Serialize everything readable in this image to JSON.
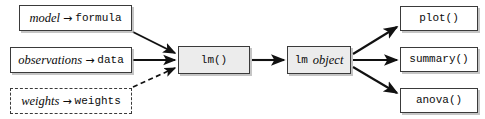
{
  "diagram": {
    "arrow_glyph": "→",
    "colors": {
      "stroke": "#3a3a3a",
      "edge": "#111111",
      "node_fill": "#ffffff",
      "node_fill_emphasis": "#ececec",
      "text": "#0b0b0b",
      "background": "#ffffff"
    },
    "inputs": [
      {
        "id": "model",
        "arg": "model",
        "connector": "→",
        "value": "formula",
        "style": "solid",
        "edge_style": "solid"
      },
      {
        "id": "observations",
        "arg": "observations",
        "connector": "→",
        "value": "data",
        "style": "solid",
        "edge_style": "solid"
      },
      {
        "id": "weights",
        "arg": "weights",
        "connector": "→",
        "value": "weights",
        "style": "dashed",
        "edge_style": "dashed"
      }
    ],
    "process": {
      "id": "lm-call",
      "label": "lm()",
      "style": "filled"
    },
    "result": {
      "id": "lm-object",
      "label_mono": "lm",
      "label_italic": "object",
      "style": "filled"
    },
    "outputs": [
      {
        "id": "plot",
        "label": "plot()"
      },
      {
        "id": "summary",
        "label": "summary()"
      },
      {
        "id": "anova",
        "label": "anova()"
      }
    ]
  }
}
